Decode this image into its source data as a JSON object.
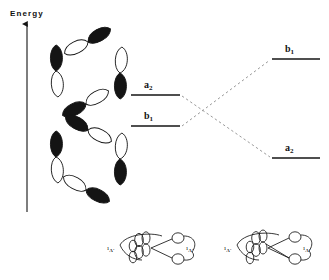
{
  "figure": {
    "type": "orbital-correlation-diagram",
    "axis": {
      "label": "Energy",
      "direction": "up",
      "x": 27,
      "y_top": 22,
      "y_bottom": 212
    },
    "ink_color": "#141414",
    "lobe_fill_dark": "#141414",
    "lobe_fill_light": "#ffffff",
    "dashed_color": "#9a9a9a"
  },
  "left_orbital_rings": [
    {
      "name": "upper-ring",
      "cx": 88,
      "cy": 72,
      "radius": 31,
      "lobes": [
        {
          "angle": 90,
          "dark_side": "outer",
          "tilt": -28
        },
        {
          "angle": 0,
          "dark_side": "inner",
          "tilt": 2
        },
        {
          "angle": 270,
          "dark_side": "outer",
          "tilt": -28
        },
        {
          "angle": 180,
          "dark_side": "outer",
          "tilt": 2
        }
      ]
    },
    {
      "name": "lower-ring",
      "cx": 88,
      "cy": 158,
      "radius": 31,
      "lobes": [
        {
          "angle": 90,
          "dark_side": "outer",
          "tilt": 28
        },
        {
          "angle": 0,
          "dark_side": "inner",
          "tilt": 2
        },
        {
          "angle": 270,
          "dark_side": "inner",
          "tilt": 28
        },
        {
          "angle": 180,
          "dark_side": "outer",
          "tilt": 2
        }
      ]
    }
  ],
  "energy_levels": {
    "left": [
      {
        "id": "left-upper",
        "label": "a",
        "sub": "2",
        "x1": 131,
        "x2": 180,
        "y": 95,
        "label_x": 148,
        "label_y": 82
      },
      {
        "id": "left-lower",
        "label": "b",
        "sub": "1",
        "x1": 131,
        "x2": 180,
        "y": 126,
        "label_x": 148,
        "label_y": 113
      }
    ],
    "right": [
      {
        "id": "right-upper",
        "label": "b",
        "sub": "1",
        "x1": 272,
        "x2": 320,
        "y": 59,
        "label_x": 289,
        "label_y": 46
      },
      {
        "id": "right-lower",
        "label": "a",
        "sub": "2",
        "x1": 272,
        "x2": 320,
        "y": 158,
        "label_x": 289,
        "label_y": 145
      }
    ]
  },
  "correlation_lines": [
    {
      "id": "a2-to-a2",
      "from": "left-upper",
      "x1": 182,
      "y1": 95,
      "x2": 270,
      "y2": 158
    },
    {
      "id": "b1-to-b1",
      "from": "left-lower",
      "x1": 182,
      "y1": 126,
      "x2": 270,
      "y2": 59
    }
  ],
  "bottom_structures": [
    {
      "id": "structure-left",
      "cx": 155,
      "cy": 248,
      "left_label": "1A'",
      "left_label_sup": "1",
      "left_label_text": "A'",
      "right_label_sup": "1",
      "right_label_text": "A'",
      "left_label_x": 108,
      "right_label_x": 182,
      "label_y": 250
    },
    {
      "id": "structure-right",
      "cx": 272,
      "cy": 248,
      "left_label_sup": "1",
      "left_label_text": "A'",
      "right_label_sup": "1",
      "right_label_text": "A'",
      "left_label_x": 224,
      "right_label_x": 299,
      "label_y": 250
    }
  ]
}
